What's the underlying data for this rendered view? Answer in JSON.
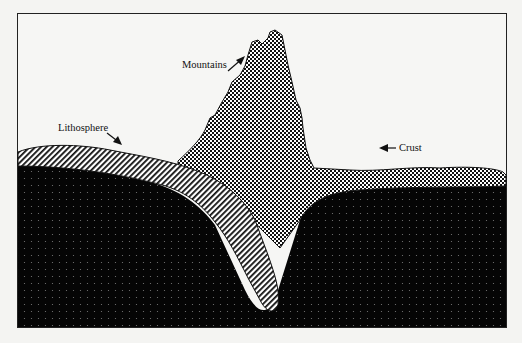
{
  "diagram": {
    "title": "",
    "labels": {
      "mountains": "Mountains",
      "lithosphere": "Lithosphere",
      "crust": "Crust"
    },
    "colors": {
      "background": "#f4f4f2",
      "frame": "#222222",
      "mantle": "#050505",
      "mantle_dots": "#7a7a7a",
      "crust_fill": "#ffffff",
      "crust_pattern": "#111111",
      "lithosphere_fill": "#ffffff",
      "lithosphere_hatch": "#111111"
    },
    "regions": [
      {
        "name": "mantle",
        "pattern": "dark-dotted"
      },
      {
        "name": "lithosphere",
        "pattern": "diagonal-hatch"
      },
      {
        "name": "crust",
        "pattern": "checker-dots"
      },
      {
        "name": "mountains",
        "pattern": "checker-dots"
      }
    ]
  }
}
